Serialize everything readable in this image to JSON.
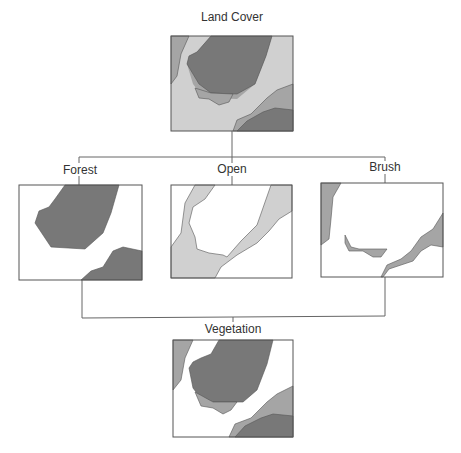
{
  "diagram": {
    "type": "classification-tree",
    "colors": {
      "forest": "#787878",
      "brush": "#a5a5a5",
      "open": "#d0d0d0",
      "background": "#ffffff",
      "outline": "#555555",
      "connector": "#666666"
    },
    "root": {
      "label": "Land Cover",
      "classes": [
        "forest",
        "brush",
        "open"
      ]
    },
    "branches": [
      {
        "label": "Forest",
        "class": "forest"
      },
      {
        "label": "Open",
        "class": "open"
      },
      {
        "label": "Brush",
        "class": "brush"
      }
    ],
    "result": {
      "label": "Vegetation",
      "classes": [
        "forest",
        "brush"
      ]
    }
  }
}
